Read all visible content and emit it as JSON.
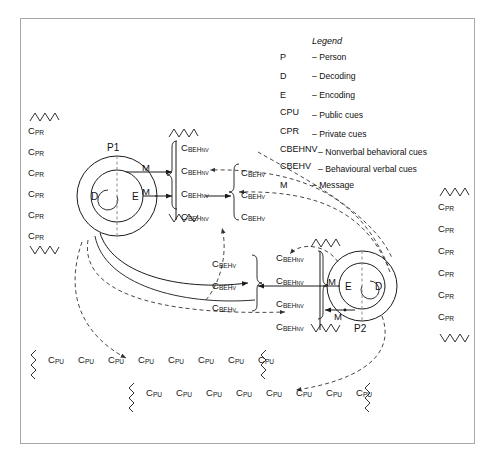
{
  "diagram": {
    "border_color": "#a8a8a8",
    "line_color": "#1a1a1a"
  },
  "legend": {
    "title": "Legend",
    "dash": "–",
    "entries": [
      {
        "key": "P",
        "key_sub": "",
        "value": "Person"
      },
      {
        "key": "D",
        "key_sub": "",
        "value": "Decoding"
      },
      {
        "key": "E",
        "key_sub": "",
        "value": "Encoding"
      },
      {
        "key": "C",
        "key_sub": "PU",
        "value": "Public cues"
      },
      {
        "key": "C",
        "key_sub": "PR",
        "value": "Private cues"
      },
      {
        "key": "C",
        "key_sub": "BEH",
        "key_sub2": "NV",
        "value": "Nonverbal behavioral cues"
      },
      {
        "key": "C",
        "key_sub": "BEH",
        "key_sub2": "V",
        "value": "Behavioural verbal cues"
      },
      {
        "key": "M",
        "key_sub": "",
        "value": "Message"
      }
    ]
  },
  "persons": {
    "left": {
      "id": "P",
      "id_sub": "1",
      "decode": "D",
      "encode": "E"
    },
    "right": {
      "id": "P",
      "id_sub": "2",
      "decode": "D",
      "encode": "E"
    }
  },
  "messages": {
    "label": "M",
    "left_count": 2,
    "right_count": 2
  },
  "cue_labels": {
    "c": "C",
    "pr": "PR",
    "pu": "PU",
    "beh": "BEH",
    "nv": "NV",
    "v": "V"
  },
  "columns": {
    "left_private": {
      "label_base": "C",
      "label_sub": "PR",
      "count": 6,
      "zigzag_top": true,
      "zigzag_bottom": true
    },
    "right_private": {
      "label_base": "C",
      "label_sub": "PR",
      "count": 6,
      "zigzag_top": true,
      "zigzag_bottom": true
    },
    "upper_nonverbal_left": {
      "label_base": "C",
      "label_sub": "BEH",
      "label_sub2": "NV",
      "count": 4,
      "zigzag_top": true,
      "zigzag_bottom": true
    },
    "upper_verbal_right": {
      "label_base": "C",
      "label_sub": "BEH",
      "label_sub2": "V",
      "count": 3,
      "zigzag_top": false,
      "zigzag_bottom": false
    },
    "lower_verbal_left": {
      "label_base": "C",
      "label_sub": "BEH",
      "label_sub2": "V",
      "count": 3,
      "zigzag_top": false,
      "zigzag_bottom": false
    },
    "lower_nonverbal_right": {
      "label_base": "C",
      "label_sub": "BEH",
      "label_sub2": "NV",
      "count": 4,
      "zigzag_top": true,
      "zigzag_bottom": true
    }
  },
  "public_rows": [
    {
      "count": 8,
      "zigzag_start": true,
      "zigzag_end": true
    },
    {
      "count": 8,
      "zigzag_start": true,
      "zigzag_end": true
    }
  ]
}
